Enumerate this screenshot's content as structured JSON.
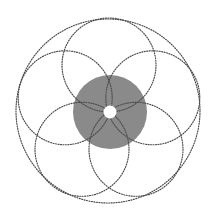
{
  "figure": {
    "canvas": {
      "width": 218,
      "height": 222,
      "background_color": "#ffffff"
    },
    "center": {
      "x": 109,
      "y": 112
    },
    "colors": {
      "stroke": "#4a4a4a",
      "disk_fill": "#8a8a8a",
      "hub_fill": "#ffffff",
      "background": "#ffffff"
    },
    "style": {
      "stroke_width": 1.15,
      "dash_on": 1.05,
      "dash_off": 1.45
    }
  },
  "chart_data": {
    "type": "scatter",
    "subtitle": "",
    "xlabel": "",
    "ylabel": "",
    "grid": false,
    "legend": "none",
    "xlim": [
      0,
      218
    ],
    "ylim": [
      0,
      222
    ],
    "center": {
      "x": 109,
      "y": 112
    },
    "petal_count": 5,
    "petal_angles_deg": [
      270,
      342,
      54,
      126,
      198
    ],
    "series": [
      {
        "name": "outer-circle",
        "shape": "circle",
        "cx": 108,
        "cy": 111,
        "r": 92,
        "style": "dotted",
        "fill": "none"
      },
      {
        "name": "rose-circle-1",
        "shape": "circle",
        "cx": 109.0,
        "cy": 65.0,
        "r": 47,
        "style": "dotted",
        "fill": "none"
      },
      {
        "name": "rose-circle-2",
        "shape": "circle",
        "cx": 152.8,
        "cy": 97.8,
        "r": 47,
        "style": "dotted",
        "fill": "none"
      },
      {
        "name": "rose-circle-3",
        "shape": "circle",
        "cx": 136.0,
        "cy": 149.3,
        "r": 47,
        "style": "dotted",
        "fill": "none"
      },
      {
        "name": "rose-circle-4",
        "shape": "circle",
        "cx": 82.0,
        "cy": 149.3,
        "r": 47,
        "style": "dotted",
        "fill": "none"
      },
      {
        "name": "rose-circle-5",
        "shape": "circle",
        "cx": 65.2,
        "cy": 97.8,
        "r": 47,
        "style": "dotted",
        "fill": "none"
      },
      {
        "name": "shaded-disk",
        "shape": "circle",
        "cx": 110,
        "cy": 112,
        "r": 37,
        "style": "solid-fill",
        "fill": "#8a8a8a"
      },
      {
        "name": "center-hub",
        "shape": "circle",
        "cx": 110,
        "cy": 112,
        "r": 6.5,
        "style": "solid-fill",
        "fill": "#ffffff"
      }
    ]
  }
}
